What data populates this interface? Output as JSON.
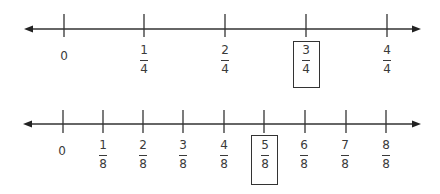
{
  "diagram": {
    "number_lines": [
      {
        "id": "fourths",
        "denominator": 4,
        "labels": [
          {
            "type": "whole",
            "text": "0"
          },
          {
            "type": "fraction",
            "numerator": "1",
            "denominator": "4"
          },
          {
            "type": "fraction",
            "numerator": "2",
            "denominator": "4"
          },
          {
            "type": "fraction",
            "numerator": "3",
            "denominator": "4",
            "boxed": true
          },
          {
            "type": "fraction",
            "numerator": "4",
            "denominator": "4"
          }
        ],
        "highlighted": "3/4"
      },
      {
        "id": "eighths",
        "denominator": 8,
        "labels": [
          {
            "type": "whole",
            "text": "0"
          },
          {
            "type": "fraction",
            "numerator": "1",
            "denominator": "8"
          },
          {
            "type": "fraction",
            "numerator": "2",
            "denominator": "8"
          },
          {
            "type": "fraction",
            "numerator": "3",
            "denominator": "8"
          },
          {
            "type": "fraction",
            "numerator": "4",
            "denominator": "8"
          },
          {
            "type": "fraction",
            "numerator": "5",
            "denominator": "8",
            "boxed": true
          },
          {
            "type": "fraction",
            "numerator": "6",
            "denominator": "8"
          },
          {
            "type": "fraction",
            "numerator": "7",
            "denominator": "8"
          },
          {
            "type": "fraction",
            "numerator": "8",
            "denominator": "8"
          }
        ],
        "highlighted": "5/8"
      }
    ],
    "colors": {
      "line": "#333333",
      "text": "#3a3a3a",
      "box": "#333333"
    }
  }
}
